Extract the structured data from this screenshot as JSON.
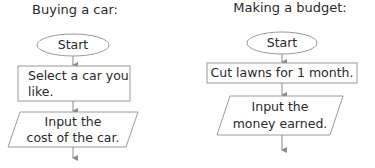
{
  "flowcharts": [
    {
      "title": "Buying a car:",
      "steps": [
        {
          "shape": "terminator",
          "text": "Start"
        },
        {
          "shape": "process",
          "line1": "Select a car you",
          "line2": "like."
        },
        {
          "shape": "input-output",
          "line1": "Input the",
          "line2": "cost of the car."
        }
      ]
    },
    {
      "title": "Making a budget:",
      "steps": [
        {
          "shape": "terminator",
          "text": "Start"
        },
        {
          "shape": "process",
          "text": "Cut lawns for 1 month."
        },
        {
          "shape": "input-output",
          "line1": "Input the",
          "line2": "money earned."
        }
      ]
    }
  ],
  "colors": {
    "stroke": "#9a9a9a",
    "arrow": "#8a8a8a",
    "text": "#2a2a2a"
  }
}
